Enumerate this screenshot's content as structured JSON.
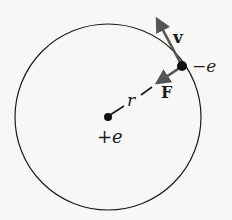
{
  "diagram": {
    "colors": {
      "background": "#f7f7f5",
      "stroke": "#1a1a1a",
      "arrow": "#555555"
    },
    "orbit": {
      "cx": 108,
      "cy": 117,
      "r": 93
    },
    "nucleus": {
      "x": 108,
      "y": 117,
      "label": "+e"
    },
    "electron": {
      "x": 182,
      "y": 66,
      "label": "−e"
    },
    "vectors": {
      "velocity": {
        "label": "v",
        "from": [
          182,
          66
        ],
        "to": [
          153,
          12
        ]
      },
      "force": {
        "label": "F",
        "from": [
          182,
          66
        ],
        "to": [
          152,
          86
        ]
      }
    },
    "radius": {
      "label": "r"
    }
  }
}
